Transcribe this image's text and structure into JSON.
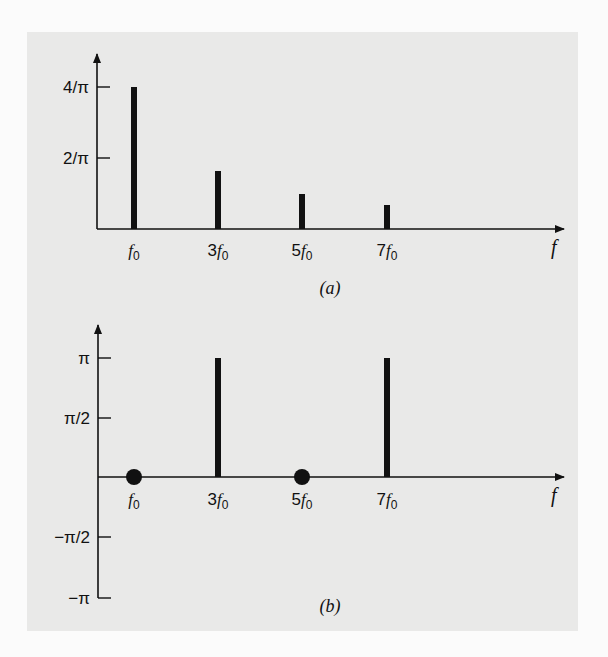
{
  "figure": {
    "panel_a": {
      "caption": "(a)",
      "x_axis_label": "f",
      "y_ticks": [
        {
          "label": "4/π",
          "value": 1.2732
        },
        {
          "label": "2/π",
          "value": 0.6366
        }
      ],
      "x_ticks": [
        "f0",
        "3f0",
        "5f0",
        "7f0"
      ]
    },
    "panel_b": {
      "caption": "(b)",
      "x_axis_label": "f",
      "y_ticks": [
        {
          "label": "π",
          "value": 3.1416
        },
        {
          "label": "π/2",
          "value": 1.5708
        },
        {
          "label": "−π/2",
          "value": -1.5708
        },
        {
          "label": "−π",
          "value": -3.1416
        }
      ],
      "x_ticks": [
        "f0",
        "3f0",
        "5f0",
        "7f0"
      ]
    },
    "colors": {
      "panel_background": "#e9e9e8",
      "page_background": "#fbfbfb",
      "ink": "#111111"
    }
  },
  "chart_data": [
    {
      "type": "bar",
      "title": "(a) Amplitude spectrum",
      "xlabel": "f",
      "ylabel": "",
      "categories": [
        "f0",
        "3f0",
        "5f0",
        "7f0"
      ],
      "values": [
        1.2732,
        0.4244,
        0.2546,
        0.1819
      ],
      "value_labels": [
        "4/π",
        "4/(3π)",
        "4/(5π)",
        "4/(7π)"
      ],
      "ytick_labels": [
        "2/π",
        "4/π"
      ],
      "ylim": [
        0,
        1.45
      ],
      "grid": false,
      "style": "line spectrum (stem bars)"
    },
    {
      "type": "bar",
      "title": "(b) Phase spectrum",
      "xlabel": "f",
      "ylabel": "",
      "categories": [
        "f0",
        "3f0",
        "5f0",
        "7f0"
      ],
      "values": [
        0,
        3.1416,
        0,
        3.1416
      ],
      "value_labels": [
        "0",
        "π",
        "0",
        "π"
      ],
      "markers": [
        "dot at zero",
        "bar",
        "dot at zero",
        "bar"
      ],
      "ytick_labels": [
        "−π",
        "−π/2",
        "π/2",
        "π"
      ],
      "ylim": [
        -3.1416,
        3.6
      ],
      "grid": false,
      "style": "line spectrum; zero-phase components drawn as filled dots"
    }
  ]
}
